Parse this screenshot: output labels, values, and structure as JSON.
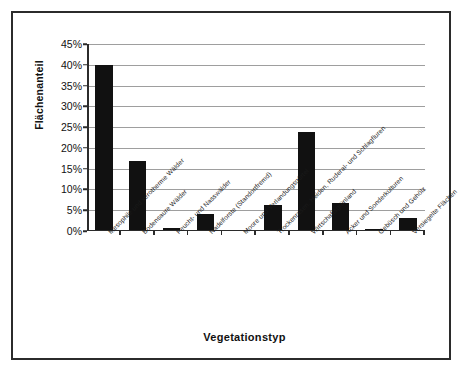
{
  "chart_data": {
    "type": "bar",
    "title": "",
    "xlabel": "Vegetationstyp",
    "ylabel": "Flächenanteil",
    "ylim": [
      0,
      45
    ],
    "ytick_labels": [
      "0%",
      "5%",
      "10%",
      "15%",
      "20%",
      "25%",
      "30%",
      "35%",
      "40%",
      "45%"
    ],
    "ytick_values": [
      0,
      5,
      10,
      15,
      20,
      25,
      30,
      35,
      40,
      45
    ],
    "grid": true,
    "legend": "none",
    "bar_color": "#111111",
    "categories": [
      "Mesophile und xerotherme Wälder",
      "Bodensaure Wälder",
      "Feucht- und Nasswälder",
      "Nadelforste (Standortfremd)",
      "Moore und Verlandungsgürtel",
      "Trockenrasen, Heiden, Ruderal- und Schlagfluren",
      "Wirtschaftsgrünland",
      "Äcker und Sonderkulturen",
      "Gebüsch und Gehölz",
      "Versiegelte Flächen"
    ],
    "values": [
      40.0,
      16.7,
      0.3,
      3.7,
      0.0,
      6.0,
      23.7,
      6.4,
      0.2,
      2.8
    ]
  }
}
